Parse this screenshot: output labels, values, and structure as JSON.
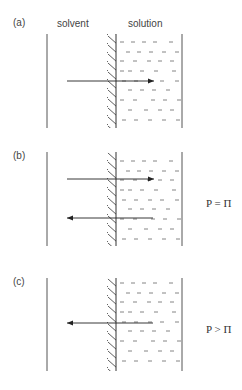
{
  "header": {
    "solvent_label": "solvent",
    "solution_label": "solution"
  },
  "panels": [
    {
      "label": "(a)",
      "arrows": [
        "right"
      ],
      "equation": ""
    },
    {
      "label": "(b)",
      "arrows": [
        "right",
        "left"
      ],
      "equation": "P = Π"
    },
    {
      "label": "(c)",
      "arrows": [
        "left"
      ],
      "equation": "P > Π"
    }
  ],
  "colors": {
    "line": "#333333",
    "dash": "#555555"
  }
}
